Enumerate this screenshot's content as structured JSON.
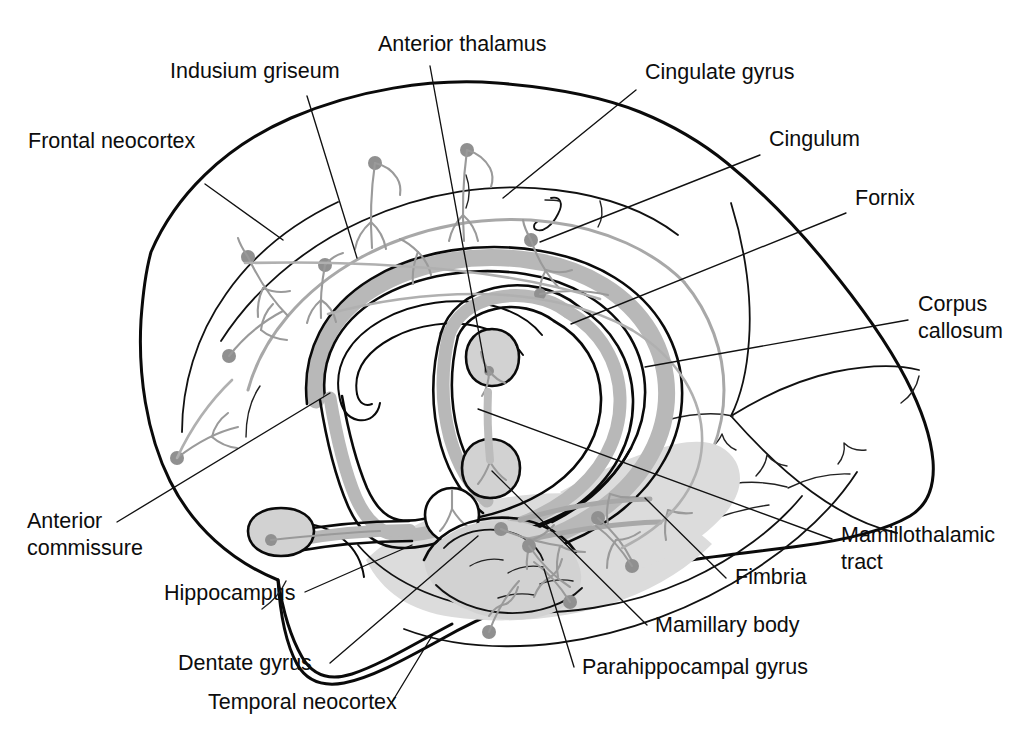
{
  "figure": {
    "background_color": "#ffffff",
    "width": 1018,
    "height": 736
  },
  "colors": {
    "ink": "#0a0a0a",
    "leader": "#111111",
    "gray_tract": "#b0b0b0",
    "gray_shade": "#d2d2d2",
    "gray_shade_light": "#dcdcdc",
    "neuron_gray": "#9a9a9a",
    "soma_gray": "#909090",
    "text": "#0d0d0d"
  },
  "labels": [
    {
      "id": "frontal-neocortex",
      "text": "Frontal neocortex",
      "x": 28,
      "y": 148,
      "anchor": "start"
    },
    {
      "id": "indusium-griseum",
      "text": "Indusium griseum",
      "x": 170,
      "y": 78,
      "anchor": "start"
    },
    {
      "id": "anterior-thalamus",
      "text": "Anterior thalamus",
      "x": 378,
      "y": 51,
      "anchor": "start"
    },
    {
      "id": "cingulate-gyrus",
      "text": "Cingulate gyrus",
      "x": 645,
      "y": 79,
      "anchor": "start"
    },
    {
      "id": "cingulum",
      "text": "Cingulum",
      "x": 769,
      "y": 146,
      "anchor": "start"
    },
    {
      "id": "fornix",
      "text": "Fornix",
      "x": 855,
      "y": 205,
      "anchor": "start"
    },
    {
      "id": "corpus-callosum-l1",
      "text": "Corpus",
      "x": 918,
      "y": 311,
      "anchor": "start"
    },
    {
      "id": "corpus-callosum-l2",
      "text": "callosum",
      "x": 918,
      "y": 338,
      "anchor": "start"
    },
    {
      "id": "mamillothalamic-l1",
      "text": "Mamillothalamic",
      "x": 841,
      "y": 542,
      "anchor": "start"
    },
    {
      "id": "mamillothalamic-l2",
      "text": "tract",
      "x": 841,
      "y": 569,
      "anchor": "start"
    },
    {
      "id": "fimbria",
      "text": "Fimbria",
      "x": 735,
      "y": 584,
      "anchor": "start"
    },
    {
      "id": "mamillary-body",
      "text": "Mamillary body",
      "x": 655,
      "y": 632,
      "anchor": "start"
    },
    {
      "id": "parahippocampal-gyrus",
      "text": "Parahippocampal gyrus",
      "x": 582,
      "y": 674,
      "anchor": "start"
    },
    {
      "id": "anterior-commissure-l1",
      "text": "Anterior",
      "x": 27,
      "y": 528,
      "anchor": "start"
    },
    {
      "id": "anterior-commissure-l2",
      "text": "commissure",
      "x": 27,
      "y": 555,
      "anchor": "start"
    },
    {
      "id": "hippocampus",
      "text": "Hippocampus",
      "x": 164,
      "y": 600,
      "anchor": "start"
    },
    {
      "id": "dentate-gyrus",
      "text": "Dentate gyrus",
      "x": 178,
      "y": 670,
      "anchor": "start"
    },
    {
      "id": "temporal-neocortex",
      "text": "Temporal neocortex",
      "x": 208,
      "y": 709,
      "anchor": "start"
    }
  ],
  "leader_lines": [
    {
      "id": "leader-frontal-neocortex",
      "d": "M 205 184 L 283 240"
    },
    {
      "id": "leader-indusium-griseum",
      "d": "M 307 96 L 357 258"
    },
    {
      "id": "leader-anterior-thalamus",
      "d": "M 430 66 L 486 372"
    },
    {
      "id": "leader-cingulate-gyrus",
      "d": "M 636 90 L 503 198"
    },
    {
      "id": "leader-cingulum",
      "d": "M 760 155 L 540 242"
    },
    {
      "id": "leader-fornix",
      "d": "M 846 213 L 571 324"
    },
    {
      "id": "leader-corpus-callosum",
      "d": "M 908 320 L 645 367"
    },
    {
      "id": "leader-mamillothalamic-tract",
      "d": "M 832 539 L 478 409"
    },
    {
      "id": "leader-fimbria",
      "d": "M 726 578 L 645 498"
    },
    {
      "id": "leader-mamillary-body",
      "d": "M 647 625 L 492 471"
    },
    {
      "id": "leader-parahippocampal-gyrus",
      "d": "M 574 667 L 544 569"
    },
    {
      "id": "leader-anterior-commissure",
      "d": "M 117 522 L 330 393"
    },
    {
      "id": "leader-hippocampus",
      "d": "M 305 592 L 412 545"
    },
    {
      "id": "leader-dentate-gyrus",
      "d": "M 330 663 L 478 536"
    },
    {
      "id": "leader-temporal-neocortex",
      "d": "M 392 702 L 432 636"
    }
  ],
  "structures": [
    {
      "id": "brain-outline",
      "name": "cerebral hemisphere outline"
    },
    {
      "id": "corpus-callosum-band",
      "name": "corpus callosum"
    },
    {
      "id": "fornix-band",
      "name": "fornix"
    },
    {
      "id": "cingulate-gyrus-arc",
      "name": "cingulate gyrus"
    },
    {
      "id": "cingulum-bundle",
      "name": "cingulum bundle"
    },
    {
      "id": "anterior-thalamus-body",
      "name": "anterior thalamic nucleus"
    },
    {
      "id": "mamillary-body-circle",
      "name": "mamillary body"
    },
    {
      "id": "anterior-commissure-oval",
      "name": "anterior commissure"
    },
    {
      "id": "hippocampus-shape",
      "name": "hippocampus"
    },
    {
      "id": "dentate-gyrus-shape",
      "name": "dentate gyrus"
    },
    {
      "id": "parahippocampal-shade",
      "name": "parahippocampal gyrus"
    },
    {
      "id": "indusium-griseum-arc",
      "name": "indusium griseum"
    },
    {
      "id": "temporal-lobe",
      "name": "temporal neocortex"
    },
    {
      "id": "occipital-lobe",
      "name": "occipital region"
    }
  ]
}
